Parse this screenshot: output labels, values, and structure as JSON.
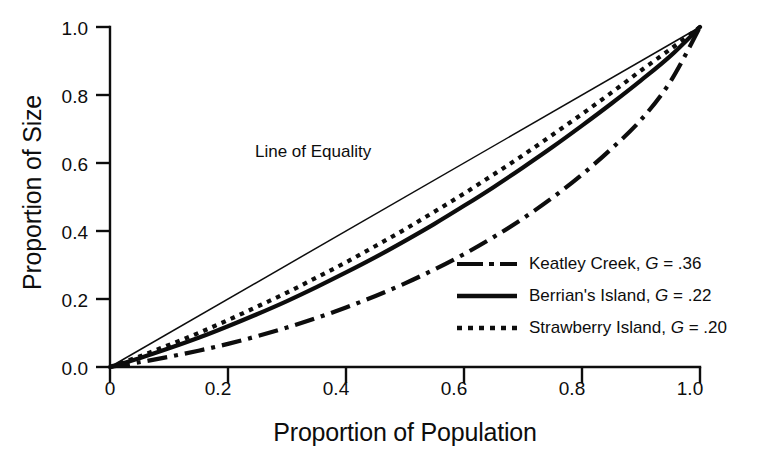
{
  "chart_data": {
    "type": "line",
    "title": "",
    "xlabel": "Proportion of Population",
    "ylabel": "Proportion of Size",
    "xlim": [
      0,
      1
    ],
    "ylim": [
      0,
      1
    ],
    "grid": false,
    "legend_position": "lower-right-inside",
    "xticks": [
      "0",
      "0.2",
      "0.4",
      "0.6",
      "0.8",
      "1.0"
    ],
    "xtick_values": [
      0,
      0.2,
      0.4,
      0.6,
      0.8,
      1.0
    ],
    "yticks": [
      "0.0",
      "0.2",
      "0.4",
      "0.6",
      "0.8",
      "1.0"
    ],
    "ytick_values": [
      0,
      0.2,
      0.4,
      0.6,
      0.8,
      1.0
    ],
    "annotations": [
      {
        "text": "Line of Equality",
        "x": 0.36,
        "y": 0.61
      }
    ],
    "x": [
      0,
      0.05,
      0.1,
      0.15,
      0.2,
      0.25,
      0.3,
      0.35,
      0.4,
      0.45,
      0.5,
      0.55,
      0.6,
      0.65,
      0.7,
      0.75,
      0.8,
      0.85,
      0.9,
      0.95,
      1.0
    ],
    "series": [
      {
        "name": "Line of Equality",
        "style": "solid-thin",
        "gini": null,
        "values": [
          0,
          0.05,
          0.1,
          0.15,
          0.2,
          0.25,
          0.3,
          0.35,
          0.4,
          0.45,
          0.5,
          0.55,
          0.6,
          0.65,
          0.7,
          0.75,
          0.8,
          0.85,
          0.9,
          0.95,
          1.0
        ]
      },
      {
        "name": "Keatley Creek",
        "style": "dash-dot",
        "gini": ".36",
        "legend_label": "Keatley Creek, G = .36",
        "values": [
          0,
          0.014,
          0.03,
          0.048,
          0.068,
          0.091,
          0.116,
          0.144,
          0.175,
          0.209,
          0.246,
          0.287,
          0.332,
          0.382,
          0.437,
          0.498,
          0.566,
          0.642,
          0.727,
          0.84,
          1.0
        ]
      },
      {
        "name": "Berrian's Island",
        "style": "solid-thick",
        "gini": ".22",
        "legend_label": "Berrian's Island, G = .22",
        "values": [
          0,
          0.026,
          0.055,
          0.086,
          0.12,
          0.156,
          0.194,
          0.235,
          0.278,
          0.323,
          0.371,
          0.421,
          0.474,
          0.529,
          0.587,
          0.647,
          0.71,
          0.775,
          0.843,
          0.915,
          1.0
        ]
      },
      {
        "name": "Strawberry Island",
        "style": "dotted",
        "gini": ".20",
        "legend_label": "Strawberry Island, G = .20",
        "values": [
          0,
          0.031,
          0.065,
          0.1,
          0.138,
          0.178,
          0.219,
          0.263,
          0.308,
          0.356,
          0.405,
          0.457,
          0.51,
          0.566,
          0.623,
          0.683,
          0.744,
          0.807,
          0.872,
          0.935,
          1.0
        ]
      }
    ]
  },
  "axis": {
    "y_title": "Proportion of Size",
    "x_title": "Proportion of Population",
    "y_tick_0": "0.0",
    "y_tick_1": "0.2",
    "y_tick_2": "0.4",
    "y_tick_3": "0.6",
    "y_tick_4": "0.8",
    "y_tick_5": "1.0",
    "x_tick_0": "0",
    "x_tick_1": "0.2",
    "x_tick_2": "0.4",
    "x_tick_3": "0.6",
    "x_tick_4": "0.8",
    "x_tick_5": "1.0"
  },
  "annotation": {
    "line_of_equality": "Line of Equality"
  },
  "legend": {
    "rows": [
      {
        "name_text": "Keatley Creek, ",
        "g_symbol": "G",
        "g_value": " = .36"
      },
      {
        "name_text": "Berrian's Island, ",
        "g_symbol": "G",
        "g_value": " = .22"
      },
      {
        "name_text": "Strawberry Island, ",
        "g_symbol": "G",
        "g_value": " = .20"
      }
    ],
    "row0_name": "Keatley Creek, ",
    "row0_g": "G",
    "row0_val": " = .36",
    "row1_name": "Berrian's Island, ",
    "row1_g": "G",
    "row1_val": " = .22",
    "row2_name": "Strawberry Island, ",
    "row2_g": "G",
    "row2_val": " = .20"
  },
  "colors": {
    "ink": "#0d0d0d",
    "background": "#ffffff"
  }
}
